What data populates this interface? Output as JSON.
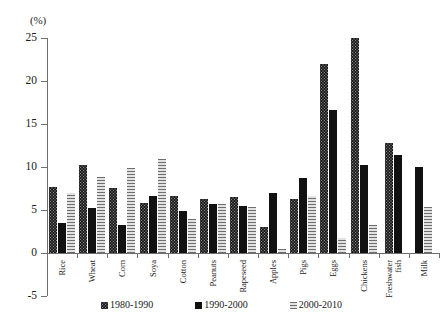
{
  "figure": {
    "unit_label": "(%)"
  },
  "chart_data": {
    "type": "bar",
    "title": "",
    "xlabel": "",
    "ylabel": "(%)",
    "ylim": [
      -5,
      25
    ],
    "yticks": [
      25,
      20,
      15,
      10,
      5,
      0,
      -5
    ],
    "ytick_labels": [
      "25",
      "20",
      "15",
      "10",
      "5",
      "0",
      "-5"
    ],
    "grid": false,
    "legend_position": "bottom",
    "categories": [
      "Rice",
      "Wheat",
      "Corn",
      "Soya",
      "Cotton",
      "Peanuts",
      "Rapeseed",
      "Apples",
      "Pigs",
      "Eggs",
      "Chickens",
      "Freshwater fish",
      "Milk"
    ],
    "series": [
      {
        "name": "1980-1990",
        "color": "#8c8c8c",
        "pattern": "checker",
        "values": [
          7.7,
          10.2,
          7.6,
          5.8,
          6.6,
          6.3,
          6.5,
          3.0,
          6.3,
          22.0,
          25.0,
          12.8,
          0.0
        ]
      },
      {
        "name": "1990-2000",
        "color": "#111111",
        "pattern": "solid",
        "values": [
          3.5,
          5.2,
          3.2,
          6.6,
          4.9,
          5.7,
          5.5,
          7.0,
          8.7,
          16.6,
          10.2,
          11.4,
          10.0
        ]
      },
      {
        "name": "2000-2010",
        "color": "#cfcfcf",
        "pattern": "horizontal-stripes",
        "values": [
          7.0,
          8.8,
          9.9,
          10.9,
          4.0,
          5.7,
          5.3,
          0.5,
          6.6,
          1.7,
          3.3,
          0.0,
          5.3
        ]
      }
    ]
  },
  "legend": {
    "items": [
      {
        "label": "1980-1990"
      },
      {
        "label": "1990-2000"
      },
      {
        "label": "2000-2010"
      }
    ]
  }
}
